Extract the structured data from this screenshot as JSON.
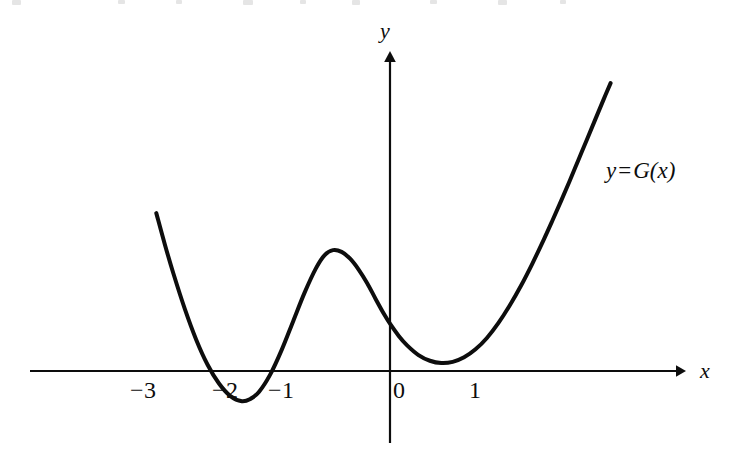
{
  "figure": {
    "background_color": "#ffffff",
    "ink_color": "#0d0d0d"
  },
  "axes": {
    "x_axis_label": "x",
    "y_axis_label": "y",
    "x_tick_labels": [
      "−3",
      "−2",
      "−1",
      "0",
      "1"
    ],
    "x_tick_values": [
      -3,
      -2,
      -1,
      0,
      1
    ],
    "y_tick_labels": []
  },
  "annotations": {
    "curve_label_y": "y",
    "curve_label_equals": "=",
    "curve_label_function": "G(x)",
    "curve_label_full": "y = G(x)"
  },
  "chart_data": {
    "type": "line",
    "title": "",
    "subtitle": "",
    "xlabel": "x",
    "ylabel": "y",
    "grid": false,
    "legend": false,
    "legend_position": "inline-right",
    "series": [
      {
        "name": "y = G(x)",
        "style": "solid",
        "color": "#0d0d0d",
        "line_width": 4,
        "x": [
          -4.1,
          -3.95,
          -3.8,
          -3.6,
          -3.4,
          -3.2,
          -3.0,
          -2.8,
          -2.6,
          -2.45,
          -2.3,
          -2.1,
          -1.9,
          -1.7,
          -1.5,
          -1.3,
          -1.15,
          -1.0,
          -0.85,
          -0.7,
          -0.55,
          -0.4,
          -0.25,
          -0.1,
          0.0,
          0.15,
          0.3,
          0.5,
          0.7,
          0.9,
          1.1,
          1.3,
          1.5,
          1.7,
          1.9,
          2.1,
          2.3,
          2.5,
          2.7,
          2.85,
          3.0,
          3.15,
          3.3,
          3.45,
          3.6,
          3.75,
          3.87
        ],
        "y": [
          2.77,
          2.22,
          1.71,
          1.09,
          0.55,
          0.11,
          -0.22,
          -0.44,
          -0.53,
          -0.49,
          -0.37,
          -0.06,
          0.37,
          0.87,
          1.37,
          1.8,
          2.03,
          2.12,
          2.09,
          1.97,
          1.78,
          1.54,
          1.26,
          0.99,
          0.83,
          0.62,
          0.45,
          0.28,
          0.18,
          0.14,
          0.16,
          0.24,
          0.38,
          0.58,
          0.84,
          1.15,
          1.5,
          1.89,
          2.31,
          2.64,
          2.98,
          3.33,
          3.69,
          4.05,
          4.41,
          4.77,
          5.05
        ]
      }
    ],
    "features": {
      "local_minimum_left": {
        "x": -2.6,
        "y": -0.53
      },
      "local_maximum": {
        "x": -1.0,
        "y": 2.12
      },
      "local_minimum_right": {
        "x": 0.9,
        "y": 0.14
      },
      "y_intercept": {
        "x": 0,
        "y": 0.83
      },
      "x_intercepts": [
        -3.3,
        -1.95
      ]
    },
    "xlim": [
      -4.5,
      4.5
    ],
    "ylim": [
      -1.5,
      5.5
    ],
    "x_axis_position": 0,
    "y_axis_position": 0
  }
}
